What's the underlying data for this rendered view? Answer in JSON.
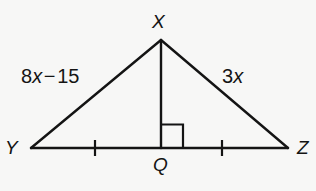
{
  "figure": {
    "name": "triangle-xyz-with-altitude",
    "background_color": "#f7f7f6",
    "stroke_color": "#141414",
    "width": 316,
    "height": 191,
    "vertices": {
      "X": {
        "label": "X",
        "x": 161,
        "y": 40
      },
      "Y": {
        "label": "Y",
        "x": 31,
        "y": 148
      },
      "Z": {
        "label": "Z",
        "x": 288,
        "y": 148
      },
      "Q": {
        "label": "Q",
        "x": 161,
        "y": 148
      }
    },
    "sides": {
      "left": {
        "expression": "8x − 15",
        "coefficient": "8",
        "variable": "x",
        "operator": "−",
        "constant": "15",
        "from": "Y",
        "to": "X"
      },
      "right": {
        "expression": "3x",
        "coefficient": "3",
        "variable": "x",
        "from": "X",
        "to": "Z"
      }
    },
    "segments": [
      {
        "name": "side-xy",
        "x1": 161,
        "y1": 40,
        "x2": 31,
        "y2": 148
      },
      {
        "name": "side-xz",
        "x1": 161,
        "y1": 40,
        "x2": 288,
        "y2": 148
      },
      {
        "name": "base-yz",
        "x1": 31,
        "y1": 148,
        "x2": 288,
        "y2": 148
      },
      {
        "name": "altitude-xq",
        "x1": 161,
        "y1": 40,
        "x2": 161,
        "y2": 148
      }
    ],
    "right_angle_marker": {
      "name": "right-angle-square-at-q",
      "x": 161,
      "y": 124,
      "size": 22,
      "side": "right"
    },
    "tick_marks": [
      {
        "name": "tick-yq",
        "x": 95,
        "y": 148,
        "half_height": 8
      },
      {
        "name": "tick-qz",
        "x": 222,
        "y": 148,
        "half_height": 8
      }
    ]
  }
}
